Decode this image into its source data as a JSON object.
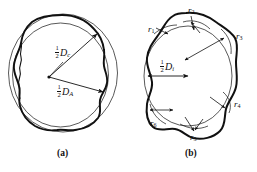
{
  "figure": {
    "type": "two-panel-line-diagram",
    "background_color": "#ffffff",
    "ink_color": "#111111",
    "panels": [
      {
        "id": "a",
        "caption": "(a)",
        "description": "Irregular closed particle outline with circumscribed and inscribed reference circles; two radius arrows drawn from a common interior center point.",
        "labels": [
          {
            "name": "half-Dc",
            "numerator": "1",
            "denominator": "2",
            "symbol": "D",
            "subscript": "c"
          },
          {
            "name": "half-DA",
            "numerator": "1",
            "denominator": "2",
            "symbol": "D",
            "subscript": "A"
          }
        ]
      },
      {
        "id": "b",
        "caption": "(b)",
        "description": "Irregular closed particle outline with an inscribed circle of diameter D sub i and six local corner curvature radii labelled r1 through r6.",
        "labels": [
          {
            "name": "half-Di",
            "numerator": "1",
            "denominator": "2",
            "symbol": "D",
            "subscript": "i"
          }
        ],
        "radii": [
          {
            "name": "r1",
            "symbol": "r",
            "subscript": "1"
          },
          {
            "name": "r2",
            "symbol": "r",
            "subscript": "2"
          },
          {
            "name": "r3",
            "symbol": "r",
            "subscript": "3"
          },
          {
            "name": "r4",
            "symbol": "r",
            "subscript": "4"
          },
          {
            "name": "r5",
            "symbol": "r",
            "subscript": "5"
          },
          {
            "name": "r6",
            "symbol": "r",
            "subscript": "6"
          }
        ]
      }
    ]
  }
}
